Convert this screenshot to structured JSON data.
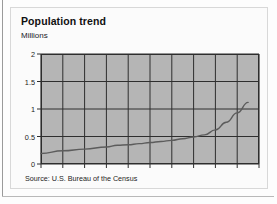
{
  "figure": {
    "title": "Population trend",
    "axis_unit_label": "Millions",
    "source": "Source: U.S. Bureau of the Census"
  },
  "colors": {
    "page_background": "#fdfdfd",
    "card_background": "#fbfbfb",
    "card_border": "#d8d8d8",
    "plot_fill": "#b5b5b5",
    "grid_line": "#2e2e2e",
    "data_line": "#5c5c5c",
    "text": "#101010"
  },
  "chart_data": {
    "type": "line",
    "title": "Population trend",
    "xlabel": "",
    "ylabel": "Millions",
    "xlim": [
      1800,
      2000
    ],
    "ylim": [
      0,
      2
    ],
    "xticks": [
      1800,
      1820,
      1840,
      1860,
      1880,
      1900,
      1920,
      1940,
      1960,
      1980,
      2000
    ],
    "yticks": [
      0,
      0.5,
      1,
      1.5,
      2
    ],
    "xtick_labels": [
      "1800",
      "1820",
      "1840",
      "1860",
      "1880",
      "1900",
      "1920",
      "1940",
      "1960",
      "1980",
      "2000"
    ],
    "ytick_labels": [
      "0",
      "0.5",
      "1",
      "1.5",
      "2"
    ],
    "grid": true,
    "legend": false,
    "series": [
      {
        "name": "Population",
        "x": [
          1800,
          1820,
          1840,
          1860,
          1870,
          1880,
          1890,
          1900,
          1910,
          1920,
          1930,
          1940,
          1950,
          1960,
          1970,
          1980,
          1990
        ],
        "values": [
          0.19,
          0.24,
          0.27,
          0.31,
          0.34,
          0.35,
          0.37,
          0.39,
          0.41,
          0.43,
          0.46,
          0.49,
          0.53,
          0.62,
          0.76,
          0.93,
          1.12
        ]
      }
    ]
  }
}
